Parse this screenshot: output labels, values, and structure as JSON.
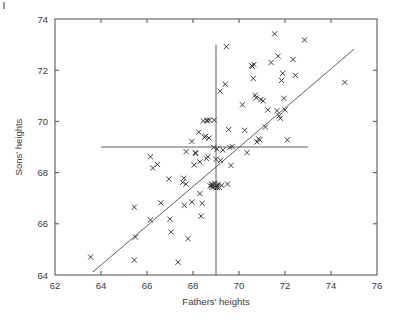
{
  "chart_data": {
    "type": "scatter",
    "title": "",
    "xlabel": "Fathers' heights",
    "ylabel": "Sons' heights",
    "xlim": [
      62,
      76
    ],
    "ylim": [
      64,
      74
    ],
    "xticks": [
      62,
      64,
      66,
      68,
      70,
      72,
      74,
      76
    ],
    "yticks": [
      64,
      66,
      68,
      70,
      72,
      74
    ],
    "xtick_labels": [
      "62",
      "64",
      "66",
      "68",
      "70",
      "72",
      "74",
      "76"
    ],
    "ytick_labels": [
      "64",
      "66",
      "68",
      "70",
      "72",
      "74"
    ],
    "grid": false,
    "legend": false,
    "marker": "x",
    "marker_color": "#2b2b2b",
    "line_color": "#4d4d4d",
    "frame_color": "#4d4d4d",
    "background": "#ffffff",
    "annotations": [
      {
        "name": "vertical-reference-line",
        "kind": "vline",
        "x": 69.0,
        "y_from": 64.0,
        "y_to": 73.0
      },
      {
        "name": "horizontal-reference-line",
        "kind": "hline",
        "y": 69.0,
        "x_from": 64.0,
        "x_to": 73.0
      },
      {
        "name": "regression-line",
        "kind": "line",
        "x_from": 63.65,
        "y_from": 64.12,
        "x_to": 75.0,
        "y_to": 72.82
      }
    ],
    "series": [
      {
        "name": "father-son heights",
        "points": [
          [
            63.55,
            64.7
          ],
          [
            65.45,
            66.65
          ],
          [
            65.45,
            64.58
          ],
          [
            65.5,
            65.48
          ],
          [
            66.15,
            68.62
          ],
          [
            66.15,
            66.15
          ],
          [
            66.25,
            68.18
          ],
          [
            66.45,
            68.32
          ],
          [
            66.6,
            66.82
          ],
          [
            66.95,
            67.75
          ],
          [
            67.0,
            66.18
          ],
          [
            67.05,
            65.68
          ],
          [
            67.35,
            64.5
          ],
          [
            67.55,
            67.62
          ],
          [
            67.6,
            67.78
          ],
          [
            67.62,
            66.72
          ],
          [
            67.7,
            68.82
          ],
          [
            67.7,
            67.55
          ],
          [
            67.78,
            65.42
          ],
          [
            67.95,
            69.22
          ],
          [
            67.95,
            66.85
          ],
          [
            68.05,
            68.3
          ],
          [
            68.1,
            68.78
          ],
          [
            68.12,
            68.75
          ],
          [
            68.25,
            69.58
          ],
          [
            68.3,
            68.42
          ],
          [
            68.3,
            67.18
          ],
          [
            68.35,
            66.3
          ],
          [
            68.4,
            66.8
          ],
          [
            68.45,
            70.02
          ],
          [
            68.5,
            69.38
          ],
          [
            68.55,
            69.42
          ],
          [
            68.58,
            68.55
          ],
          [
            68.6,
            70.05
          ],
          [
            68.62,
            70.02
          ],
          [
            68.65,
            68.62
          ],
          [
            68.7,
            69.35
          ],
          [
            68.72,
            70.05
          ],
          [
            68.75,
            67.48
          ],
          [
            68.8,
            67.55
          ],
          [
            68.82,
            67.45
          ],
          [
            68.85,
            67.52
          ],
          [
            68.88,
            67.42
          ],
          [
            68.9,
            68.98
          ],
          [
            68.92,
            70.05
          ],
          [
            68.95,
            67.58
          ],
          [
            68.98,
            67.48
          ],
          [
            69.0,
            68.52
          ],
          [
            69.02,
            67.4
          ],
          [
            69.05,
            67.45
          ],
          [
            69.05,
            68.92
          ],
          [
            69.1,
            67.55
          ],
          [
            69.15,
            67.42
          ],
          [
            69.18,
            71.18
          ],
          [
            69.2,
            68.48
          ],
          [
            69.25,
            67.5
          ],
          [
            69.3,
            68.88
          ],
          [
            69.4,
            71.45
          ],
          [
            69.45,
            72.92
          ],
          [
            69.5,
            67.55
          ],
          [
            69.55,
            69.68
          ],
          [
            69.6,
            68.98
          ],
          [
            69.65,
            68.28
          ],
          [
            69.7,
            69.02
          ],
          [
            70.15,
            70.65
          ],
          [
            70.25,
            69.65
          ],
          [
            70.35,
            68.78
          ],
          [
            70.55,
            72.18
          ],
          [
            70.58,
            72.15
          ],
          [
            70.62,
            71.68
          ],
          [
            70.65,
            72.22
          ],
          [
            70.7,
            71.02
          ],
          [
            70.75,
            70.92
          ],
          [
            70.78,
            69.2
          ],
          [
            70.85,
            69.32
          ],
          [
            70.9,
            69.28
          ],
          [
            70.95,
            70.85
          ],
          [
            71.05,
            70.8
          ],
          [
            71.15,
            69.78
          ],
          [
            71.25,
            70.45
          ],
          [
            71.4,
            72.3
          ],
          [
            71.55,
            73.42
          ],
          [
            71.65,
            70.42
          ],
          [
            71.7,
            72.55
          ],
          [
            71.75,
            70.22
          ],
          [
            71.8,
            70.12
          ],
          [
            71.85,
            71.6
          ],
          [
            71.9,
            71.88
          ],
          [
            71.95,
            70.9
          ],
          [
            72.0,
            70.45
          ],
          [
            72.1,
            69.28
          ],
          [
            72.35,
            72.42
          ],
          [
            72.45,
            71.8
          ],
          [
            72.85,
            73.18
          ],
          [
            74.6,
            71.52
          ]
        ]
      }
    ]
  },
  "figure": {
    "corner_mark_name": "crop-tick-mark"
  }
}
